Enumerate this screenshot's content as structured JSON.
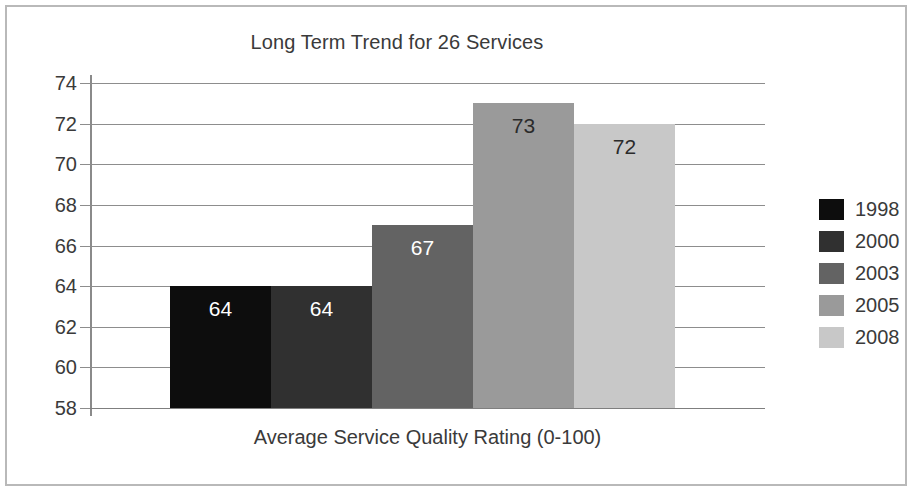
{
  "chart_data": {
    "type": "bar",
    "title": "Long Term Trend for 26 Services",
    "xlabel": "Average Service Quality Rating (0-100)",
    "ylabel": "",
    "categories": [
      "1998",
      "2000",
      "2003",
      "2005",
      "2008"
    ],
    "values": [
      64,
      64,
      67,
      73,
      72
    ],
    "data_labels": [
      "64",
      "64",
      "67",
      "73",
      "72"
    ],
    "ylim": [
      58,
      74
    ],
    "yticks": [
      74,
      72,
      70,
      68,
      66,
      64,
      62,
      60,
      58
    ],
    "ytick_labels": [
      "74",
      "72",
      "70",
      "68",
      "66",
      "64",
      "62",
      "60",
      "58"
    ],
    "grid": true,
    "legend_position": "right",
    "series": [
      {
        "name": "1998",
        "value": 64,
        "color": "#0d0d0d",
        "label_color": "#ffffff"
      },
      {
        "name": "2000",
        "value": 64,
        "color": "#303030",
        "label_color": "#ffffff"
      },
      {
        "name": "2003",
        "value": 67,
        "color": "#636363",
        "label_color": "#ffffff"
      },
      {
        "name": "2005",
        "value": 73,
        "color": "#9a9a9a",
        "label_color": "#2b2b2b"
      },
      {
        "name": "2008",
        "value": 72,
        "color": "#c8c8c8",
        "label_color": "#2b2b2b"
      }
    ],
    "legend": [
      {
        "label": "1998",
        "color": "#0d0d0d"
      },
      {
        "label": "2000",
        "color": "#303030"
      },
      {
        "label": "2003",
        "color": "#636363"
      },
      {
        "label": "2005",
        "color": "#9a9a9a"
      },
      {
        "label": "2008",
        "color": "#c8c8c8"
      }
    ],
    "colors": {
      "gridline": "#8d8d8d",
      "axis": "#8a8a8a",
      "text": "#3a3a3a",
      "frame": "#b9b9b9",
      "background": "#ffffff"
    }
  }
}
